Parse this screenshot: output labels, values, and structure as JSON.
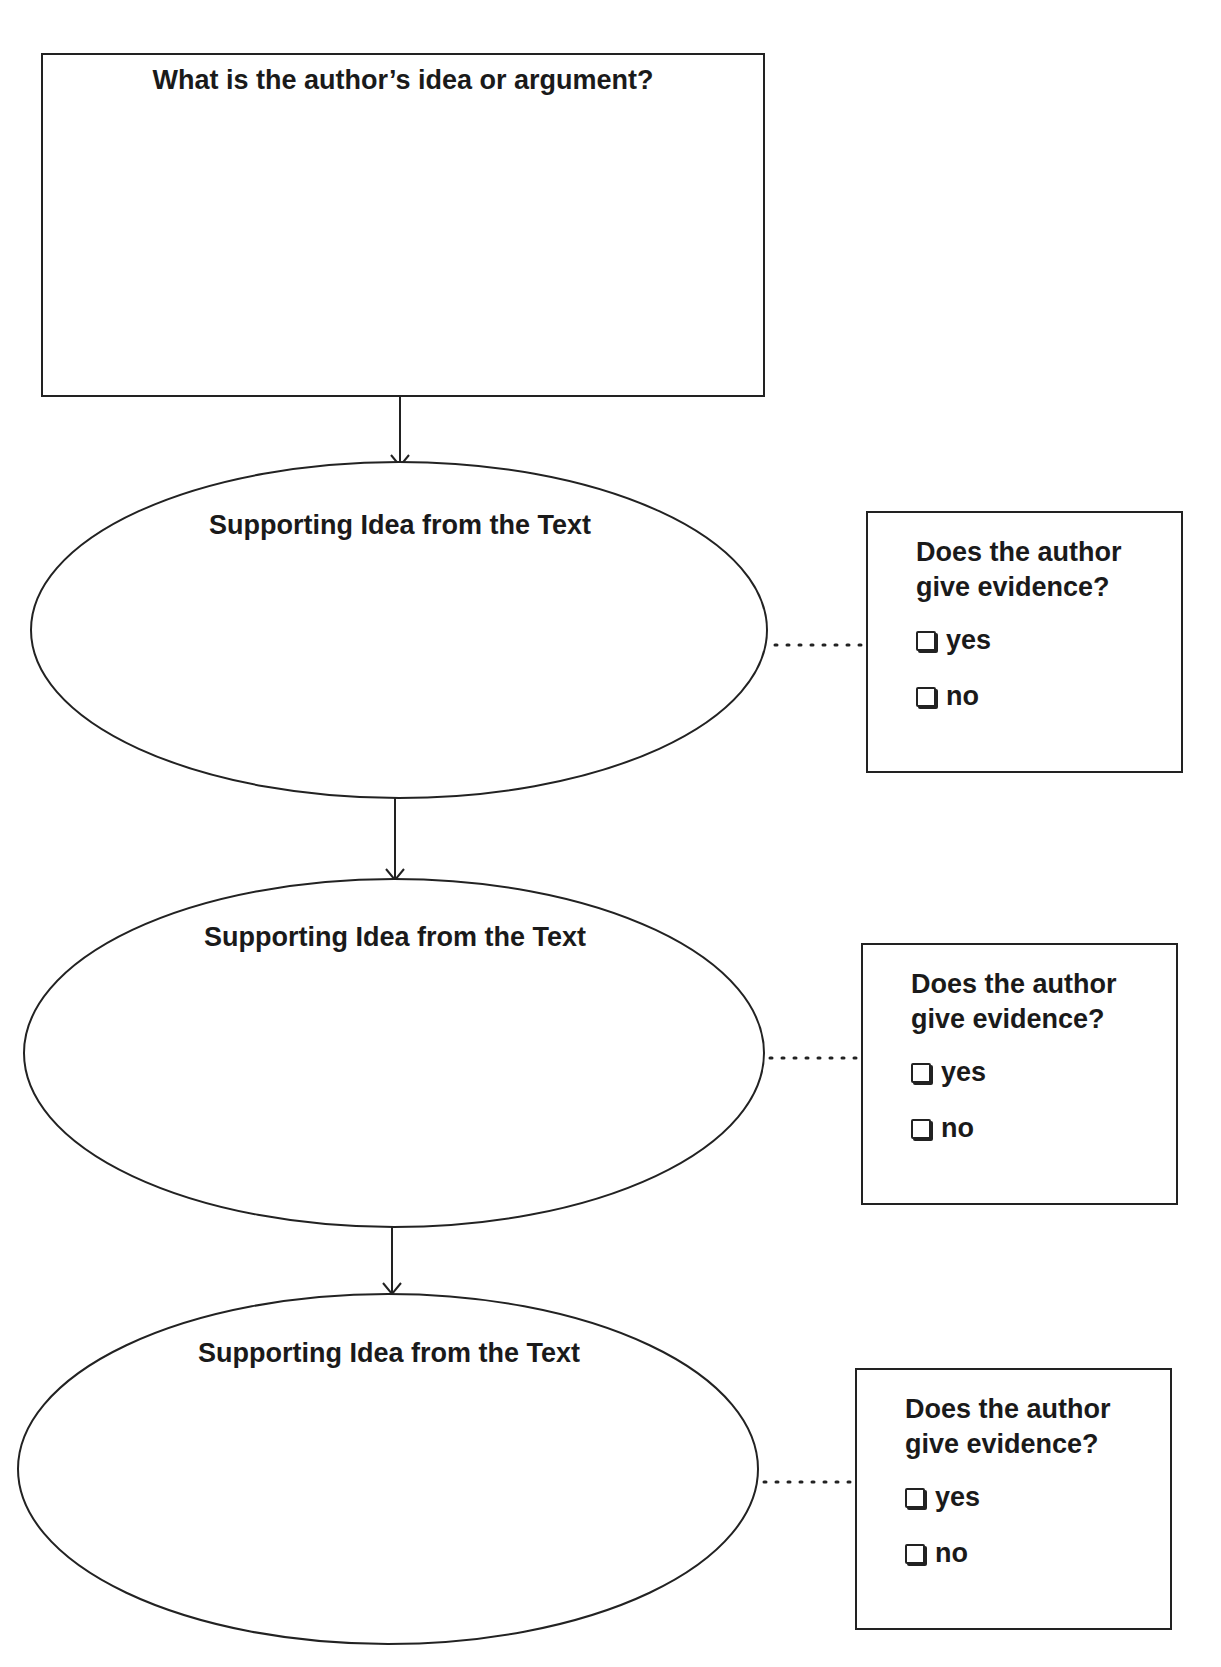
{
  "main_question": {
    "label": "What is the author’s idea or argument?"
  },
  "supporting_ideas": [
    {
      "label": "Supporting Idea from the Text",
      "evidence": {
        "question_line1": "Does the author",
        "question_line2": "give evidence?",
        "options": [
          "yes",
          "no"
        ]
      }
    },
    {
      "label": "Supporting Idea from the Text",
      "evidence": {
        "question_line1": "Does the author",
        "question_line2": "give evidence?",
        "options": [
          "yes",
          "no"
        ]
      }
    },
    {
      "label": "Supporting Idea from the Text",
      "evidence": {
        "question_line1": "Does the author",
        "question_line2": "give evidence?",
        "options": [
          "yes",
          "no"
        ]
      }
    }
  ],
  "icons": {
    "arrow": "arrow-down-icon",
    "checkbox": "checkbox-empty-icon"
  },
  "colors": {
    "stroke": "#222222",
    "background": "#ffffff"
  }
}
